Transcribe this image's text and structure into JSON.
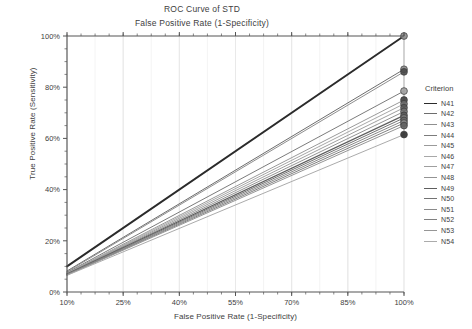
{
  "chart_data": {
    "type": "line",
    "title": "ROC Curve of STD",
    "subtitle": "False Positive Rate (1-Specificity)",
    "xlabel": "False Positive Rate (1-Specificity)",
    "ylabel": "True Positive Rate (Sensitivity)",
    "xlim": [
      10,
      100
    ],
    "ylim": [
      0,
      100
    ],
    "xticks": [
      "10%",
      "25%",
      "40%",
      "55%",
      "70%",
      "85%",
      "100%"
    ],
    "xtick_values": [
      10,
      25,
      40,
      55,
      70,
      85,
      100
    ],
    "yticks": [
      "0%",
      "20%",
      "40%",
      "60%",
      "80%",
      "100%"
    ],
    "ytick_values": [
      0,
      20,
      40,
      60,
      80,
      100
    ],
    "grid": "vertical",
    "legend_position": "right",
    "legend_title": "Criterion",
    "marker": "circle",
    "series": [
      {
        "name": "N41",
        "x": [
          10,
          100
        ],
        "values": [
          10.0,
          100.0
        ],
        "color": "#2b2b2b",
        "width": 1.9,
        "endpoint": 100.0
      },
      {
        "name": "N42",
        "x": [
          10,
          100
        ],
        "values": [
          8.2,
          87.0
        ],
        "color": "#6d6d6d",
        "width": 1.0,
        "endpoint": 87.0
      },
      {
        "name": "N43",
        "x": [
          10,
          100
        ],
        "values": [
          7.9,
          86.0
        ],
        "color": "#8f8f8f",
        "width": 1.0,
        "endpoint": 86.0
      },
      {
        "name": "N44",
        "x": [
          10,
          100
        ],
        "values": [
          7.6,
          78.5
        ],
        "color": "#7c7c7c",
        "width": 1.0,
        "endpoint": 78.5
      },
      {
        "name": "N45",
        "x": [
          10,
          100
        ],
        "values": [
          7.4,
          75.0
        ],
        "color": "#9a9a9a",
        "width": 1.0,
        "endpoint": 75.0
      },
      {
        "name": "N46",
        "x": [
          10,
          100
        ],
        "values": [
          7.3,
          73.5
        ],
        "color": "#a8a8a8",
        "width": 1.0,
        "endpoint": 73.5
      },
      {
        "name": "N47",
        "x": [
          10,
          100
        ],
        "values": [
          7.2,
          72.0
        ],
        "color": "#9f9f9f",
        "width": 1.0,
        "endpoint": 72.0
      },
      {
        "name": "N48",
        "x": [
          10,
          100
        ],
        "values": [
          7.1,
          70.5
        ],
        "color": "#939393",
        "width": 1.0,
        "endpoint": 70.5
      },
      {
        "name": "N49",
        "x": [
          10,
          100
        ],
        "values": [
          7.0,
          69.0
        ],
        "color": "#5e5e5e",
        "width": 1.2,
        "endpoint": 69.0
      },
      {
        "name": "N50",
        "x": [
          10,
          100
        ],
        "values": [
          6.9,
          68.0
        ],
        "color": "#737373",
        "width": 1.0,
        "endpoint": 68.0
      },
      {
        "name": "N51",
        "x": [
          10,
          100
        ],
        "values": [
          6.8,
          67.0
        ],
        "color": "#8a8a8a",
        "width": 1.0,
        "endpoint": 67.0
      },
      {
        "name": "N52",
        "x": [
          10,
          100
        ],
        "values": [
          6.7,
          66.0
        ],
        "color": "#808080",
        "width": 1.0,
        "endpoint": 66.0
      },
      {
        "name": "N53",
        "x": [
          10,
          100
        ],
        "values": [
          6.6,
          65.0
        ],
        "color": "#969696",
        "width": 1.0,
        "endpoint": 65.0
      },
      {
        "name": "N54",
        "x": [
          10,
          100
        ],
        "values": [
          6.5,
          61.5
        ],
        "color": "#ababab",
        "width": 1.0,
        "endpoint": 61.5
      }
    ],
    "endpoint_markers": [
      {
        "series": "N41",
        "x": 100,
        "y": 100.0,
        "color": "#8c8c8c"
      },
      {
        "series": "N42",
        "x": 100,
        "y": 87.0,
        "color": "#8c8c8c"
      },
      {
        "series": "N43",
        "x": 100,
        "y": 86.0,
        "color": "#4a4a4a"
      },
      {
        "series": "N44",
        "x": 100,
        "y": 78.5,
        "color": "#a0a0a0"
      },
      {
        "series": "N45",
        "x": 100,
        "y": 75.0,
        "color": "#3f3f3f"
      },
      {
        "series": "N46",
        "x": 100,
        "y": 73.5,
        "color": "#6b6b6b"
      },
      {
        "series": "N47",
        "x": 100,
        "y": 72.0,
        "color": "#555555"
      },
      {
        "series": "N48",
        "x": 100,
        "y": 70.5,
        "color": "#707070"
      },
      {
        "series": "N49",
        "x": 100,
        "y": 69.0,
        "color": "#5a5a5a"
      },
      {
        "series": "N50",
        "x": 100,
        "y": 68.0,
        "color": "#7a7a7a"
      },
      {
        "series": "N51",
        "x": 100,
        "y": 67.0,
        "color": "#686868"
      },
      {
        "series": "N52",
        "x": 100,
        "y": 66.0,
        "color": "#8c8c8c"
      },
      {
        "series": "N53",
        "x": 100,
        "y": 65.0,
        "color": "#606060"
      },
      {
        "series": "N54",
        "x": 100,
        "y": 61.5,
        "color": "#2e2e2e"
      }
    ]
  },
  "colors": {
    "background": "#ffffff",
    "axis": "#555555",
    "grid": "#dcdcdc",
    "text": "#3e3e3e"
  }
}
